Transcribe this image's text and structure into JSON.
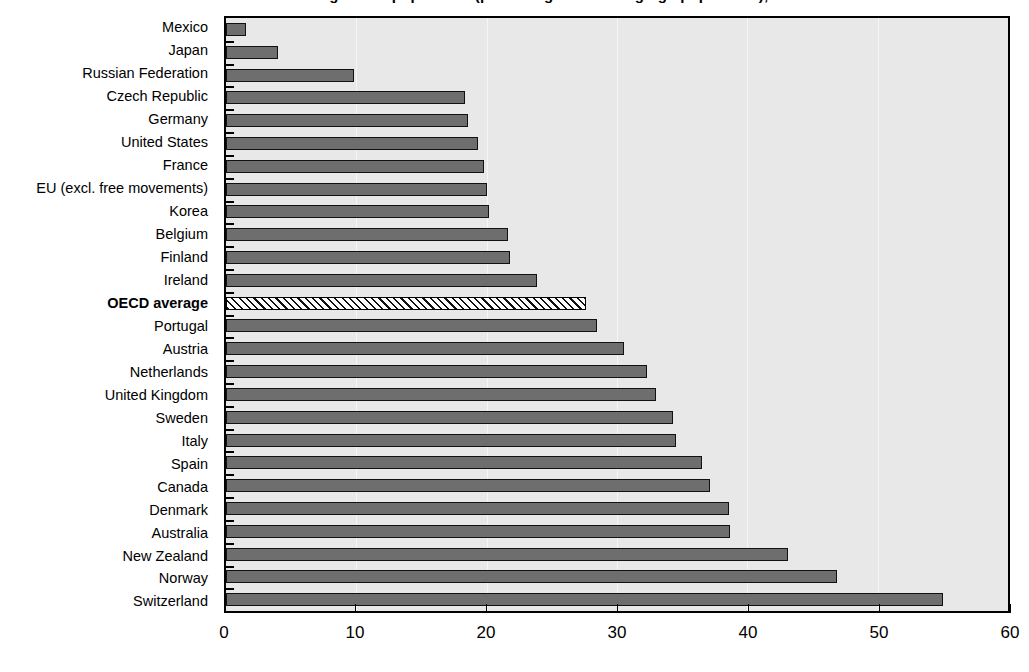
{
  "chart_data": {
    "type": "bar",
    "orientation": "horizontal",
    "title": "Stocks of foreign-born population (percentage of working-age population), 2002",
    "xlabel": "",
    "ylabel": "",
    "xlim": [
      0,
      60
    ],
    "xticks": [
      0,
      10,
      20,
      30,
      40,
      50,
      60
    ],
    "xtick_labels": [
      "0",
      "10",
      "20",
      "30",
      "40",
      "50",
      "60"
    ],
    "grid": false,
    "legend": "none",
    "categories": [
      "Mexico",
      "Japan",
      "Russian Federation",
      "Czech Republic",
      "Germany",
      "United States",
      "France",
      "EU (excl. free movements)",
      "Korea",
      "Belgium",
      "Finland",
      "Ireland",
      "OECD average",
      "Portugal",
      "Austria",
      "Netherlands",
      "United Kingdom",
      "Sweden",
      "Italy",
      "Spain",
      "Canada",
      "Denmark",
      "Australia",
      "New Zealand",
      "Norway",
      "Switzerland"
    ],
    "values": [
      1.5,
      4.0,
      9.8,
      18.3,
      18.6,
      19.3,
      19.8,
      20.0,
      20.2,
      21.6,
      21.8,
      23.9,
      27.6,
      28.5,
      30.5,
      32.3,
      33.0,
      34.3,
      34.5,
      36.5,
      37.1,
      38.6,
      38.7,
      43.1,
      46.9,
      55.0
    ],
    "highlighted_category": "OECD average",
    "highlight_style": "hatched",
    "bar_color": "#6e6e6e",
    "bar_border_color": "#111111",
    "plot_background": "#e8e8e8",
    "axis_color": "#000000"
  }
}
